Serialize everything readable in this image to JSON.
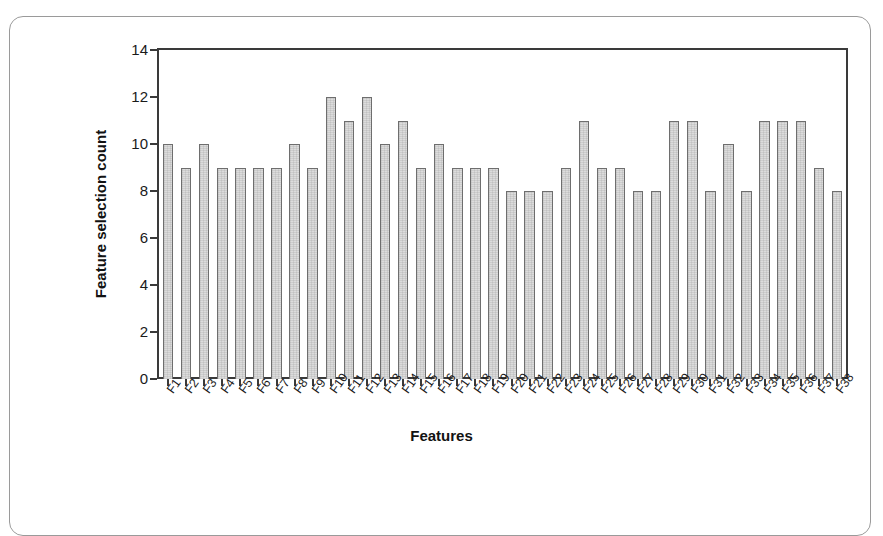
{
  "figure": {
    "frame_color": "#9a9a9a",
    "axis_color": "#3a3a3a",
    "bar_fill": "#dcdcdc",
    "bar_edge": "#6e6e6e"
  },
  "chart_data": {
    "type": "bar",
    "title": "",
    "xlabel": "Features",
    "ylabel": "Feature selection count",
    "ylim": [
      0,
      14
    ],
    "yticks": [
      0,
      2,
      4,
      6,
      8,
      10,
      12,
      14
    ],
    "ytick_labels": [
      "0",
      "2",
      "4",
      "6",
      "8",
      "10",
      "12",
      "14"
    ],
    "grid": false,
    "legend": null,
    "categories": [
      "F1",
      "F2",
      "F3",
      "F4",
      "F5",
      "F6",
      "F7",
      "F8",
      "F9",
      "F10",
      "F11",
      "F12",
      "F13",
      "F14",
      "F15",
      "F16",
      "F17",
      "F18",
      "F19",
      "F20",
      "F21",
      "F22",
      "F23",
      "F24",
      "F25",
      "F26",
      "F27",
      "F28",
      "F29",
      "F30",
      "F31",
      "F32",
      "F33",
      "F34",
      "F35",
      "F36",
      "F37",
      "F38"
    ],
    "values": [
      10,
      9,
      10,
      9,
      9,
      9,
      9,
      10,
      9,
      12,
      11,
      12,
      10,
      11,
      9,
      10,
      9,
      9,
      9,
      8,
      8,
      8,
      9,
      11,
      9,
      9,
      8,
      8,
      11,
      11,
      8,
      10,
      8,
      11,
      11,
      11,
      9,
      8
    ]
  }
}
